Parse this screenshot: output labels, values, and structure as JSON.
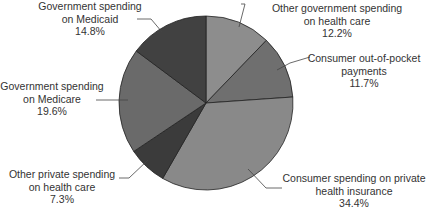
{
  "chart_data": {
    "type": "pie",
    "title": "",
    "start_angle_deg": 0,
    "direction": "clockwise",
    "center": [
      206,
      103
    ],
    "radius": 87,
    "slices": [
      {
        "label_lines": [
          "Other government spending",
          "on health care"
        ],
        "value": 12.2,
        "value_label": "12.2%",
        "color": "#8d8d8d"
      },
      {
        "label_lines": [
          "Consumer out-of-pocket",
          "payments"
        ],
        "value": 11.7,
        "value_label": "11.7%",
        "color": "#6f6f6f"
      },
      {
        "label_lines": [
          "Consumer spending on private",
          "health insurance"
        ],
        "value": 34.4,
        "value_label": "34.4%",
        "color": "#898989"
      },
      {
        "label_lines": [
          "Other private spending",
          "on health care"
        ],
        "value": 7.3,
        "value_label": "7.3%",
        "color": "#3b3b3b"
      },
      {
        "label_lines": [
          "Government spending",
          "on Medicare"
        ],
        "value": 19.6,
        "value_label": "19.6%",
        "color": "#6a6a6a"
      },
      {
        "label_lines": [
          "Government spending",
          "on Medicaid"
        ],
        "value": 14.8,
        "value_label": "14.8%",
        "color": "#414141"
      }
    ],
    "legend": "none (direct callout labels with leader lines)"
  },
  "labels": [
    {
      "l1": "Other government spending",
      "l2": "on health care",
      "pct": "12.2%"
    },
    {
      "l1": "Consumer out-of-pocket",
      "l2": "payments",
      "pct": "11.7%"
    },
    {
      "l1": "Consumer spending on private",
      "l2": "health insurance",
      "pct": "34.4%"
    },
    {
      "l1": "Other private spending",
      "l2": "on health care",
      "pct": "7.3%"
    },
    {
      "l1": "Government spending",
      "l2": "on Medicare",
      "pct": "19.6%"
    },
    {
      "l1": "Government spending",
      "l2": "on Medicaid",
      "pct": "14.8%"
    }
  ],
  "footer_text": "Source: ..."
}
